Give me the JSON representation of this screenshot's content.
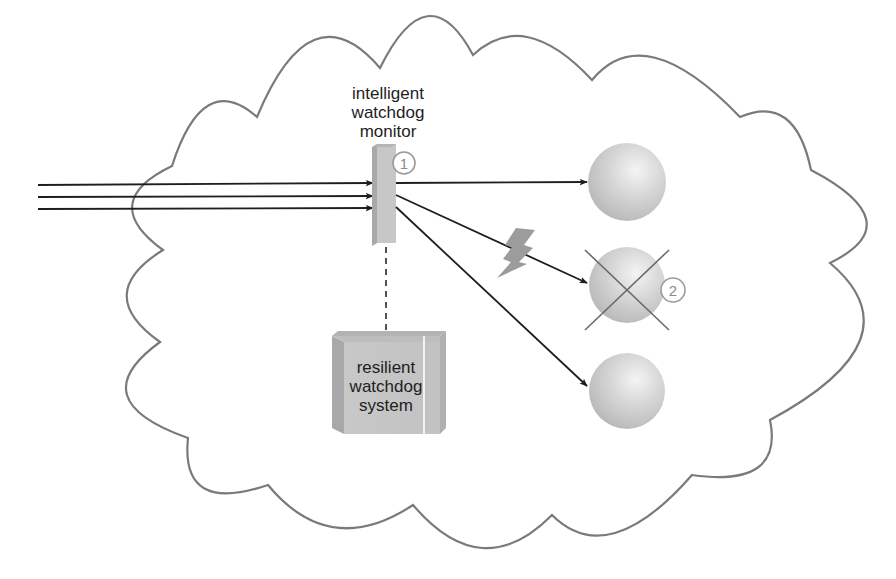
{
  "diagram": {
    "title": "",
    "colors": {
      "cloud_stroke": "#7a7a7a",
      "arrow": "#1e1e1e",
      "sphere_light": "#f2f2f2",
      "sphere_dark": "#b8b8b8",
      "component_gray": "#c4c4c4",
      "component_dark": "#a8a8a8",
      "bolt": "#9c9c9c",
      "cross": "#6a6a6a",
      "badge": "#9a9a9a"
    },
    "nodes": {
      "monitor": {
        "label_lines": [
          "intelligent",
          "watchdog",
          "monitor"
        ],
        "badge": "1"
      },
      "resilient_system": {
        "label_lines": [
          "resilient",
          "watchdog",
          "system"
        ]
      },
      "servers": [
        {
          "id": "server-top",
          "status": "ok"
        },
        {
          "id": "server-middle",
          "status": "failed",
          "badge": "2"
        },
        {
          "id": "server-bottom",
          "status": "ok"
        }
      ]
    },
    "edges": {
      "incoming_arrows": 3,
      "outgoing": [
        {
          "to": "server-top"
        },
        {
          "to": "server-middle",
          "fault": "lightning"
        },
        {
          "to": "server-bottom"
        }
      ],
      "monitor_to_system": "dashed"
    }
  }
}
